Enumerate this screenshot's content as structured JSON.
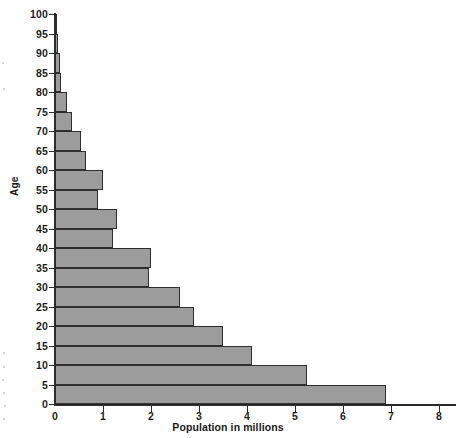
{
  "chart_data": {
    "type": "bar",
    "orientation": "horizontal",
    "title": "",
    "subtitle": "",
    "xlabel": "Population in millions",
    "ylabel": "Age",
    "xlim": [
      0,
      8.4
    ],
    "ylim": [
      0,
      100
    ],
    "grid": false,
    "legend": null,
    "bar_color": "#9c9c9c",
    "bar_edge_color": "#2e2e2e",
    "x_ticks": [
      0,
      1,
      2,
      3,
      4,
      5,
      6,
      7,
      8
    ],
    "x_tick_labels": [
      "0",
      "1",
      "2",
      "3",
      "4",
      "5",
      "6",
      "7",
      "8"
    ],
    "y_ticks": [
      0,
      5,
      10,
      15,
      20,
      25,
      30,
      35,
      40,
      45,
      50,
      55,
      60,
      65,
      70,
      75,
      80,
      85,
      90,
      95,
      100
    ],
    "y_tick_labels": [
      "0",
      "5",
      "10",
      "15",
      "20",
      "25",
      "30",
      "35",
      "40",
      "45",
      "50",
      "55",
      "60",
      "65",
      "70",
      "75",
      "80",
      "85",
      "90",
      "95",
      "100"
    ],
    "categories": [
      "0-5",
      "5-10",
      "10-15",
      "15-20",
      "20-25",
      "25-30",
      "30-35",
      "35-40",
      "40-45",
      "45-50",
      "50-55",
      "55-60",
      "60-65",
      "65-70",
      "70-75",
      "75-80",
      "80-85",
      "85-90",
      "90-95",
      "95-100"
    ],
    "values": [
      6.9,
      5.25,
      4.1,
      3.5,
      2.9,
      2.6,
      1.95,
      2.0,
      1.2,
      1.3,
      0.9,
      1.0,
      0.65,
      0.55,
      0.35,
      0.25,
      0.13,
      0.1,
      0.07,
      0.04
    ],
    "bars": [
      {
        "age_band": "0-5",
        "age_low": 0,
        "age_high": 5,
        "value": 6.9
      },
      {
        "age_band": "5-10",
        "age_low": 5,
        "age_high": 10,
        "value": 5.25
      },
      {
        "age_band": "10-15",
        "age_low": 10,
        "age_high": 15,
        "value": 4.1
      },
      {
        "age_band": "15-20",
        "age_low": 15,
        "age_high": 20,
        "value": 3.5
      },
      {
        "age_band": "20-25",
        "age_low": 20,
        "age_high": 25,
        "value": 2.9
      },
      {
        "age_band": "25-30",
        "age_low": 25,
        "age_high": 30,
        "value": 2.6
      },
      {
        "age_band": "30-35",
        "age_low": 30,
        "age_high": 35,
        "value": 1.95
      },
      {
        "age_band": "35-40",
        "age_low": 35,
        "age_high": 40,
        "value": 2.0
      },
      {
        "age_band": "40-45",
        "age_low": 40,
        "age_high": 45,
        "value": 1.2
      },
      {
        "age_band": "45-50",
        "age_low": 45,
        "age_high": 50,
        "value": 1.3
      },
      {
        "age_band": "50-55",
        "age_low": 50,
        "age_high": 55,
        "value": 0.9
      },
      {
        "age_band": "55-60",
        "age_low": 55,
        "age_high": 60,
        "value": 1.0
      },
      {
        "age_band": "60-65",
        "age_low": 60,
        "age_high": 65,
        "value": 0.65
      },
      {
        "age_band": "65-70",
        "age_low": 65,
        "age_high": 70,
        "value": 0.55
      },
      {
        "age_band": "70-75",
        "age_low": 70,
        "age_high": 75,
        "value": 0.35
      },
      {
        "age_band": "75-80",
        "age_low": 75,
        "age_high": 80,
        "value": 0.25
      },
      {
        "age_band": "80-85",
        "age_low": 80,
        "age_high": 85,
        "value": 0.13
      },
      {
        "age_band": "85-90",
        "age_low": 85,
        "age_high": 90,
        "value": 0.1
      },
      {
        "age_band": "90-95",
        "age_low": 90,
        "age_high": 95,
        "value": 0.07
      },
      {
        "age_band": "95-100",
        "age_low": 95,
        "age_high": 100,
        "value": 0.04
      }
    ]
  },
  "geometry": {
    "origin_x": 55,
    "origin_y": 404,
    "px_per_unit_x": 48.0,
    "px_per_unit_y": 3.9,
    "x_axis_end": 456,
    "y_axis_top": 13
  }
}
